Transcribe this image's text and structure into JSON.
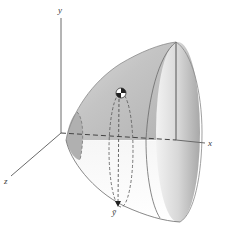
{
  "figure": {
    "type": "paraboloid-of-revolution-centroid",
    "axes": {
      "y_label": "y",
      "x_label": "x",
      "z_label": "z"
    },
    "centroid_label": "ȳ",
    "colors": {
      "surface_light": "#ececec",
      "surface_mid": "#c9c9c9",
      "surface_dark": "#a9a9a9",
      "outline": "#5a5a5a",
      "axis": "#6a6a6a",
      "background": "#ffffff"
    }
  }
}
